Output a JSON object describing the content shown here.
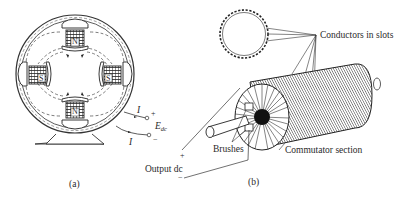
{
  "figure_a": {
    "caption": "(a)",
    "poles": [
      {
        "position": "top",
        "label": "N"
      },
      {
        "position": "left",
        "label": "S"
      },
      {
        "position": "right",
        "label": "S"
      },
      {
        "position": "bottom",
        "label": "N"
      }
    ],
    "current_label_top": "I",
    "current_label_bottom": "I",
    "terminal_plus": "+",
    "terminal_minus": "−",
    "voltage_label": "E",
    "voltage_subscript": "dc"
  },
  "figure_b": {
    "caption": "(b)",
    "labels": {
      "conductors": "Conductors in slots",
      "brushes": "Brushes",
      "commutator": "Commutator section",
      "output": "Output dc",
      "output_plus": "+",
      "output_minus": "−"
    }
  }
}
